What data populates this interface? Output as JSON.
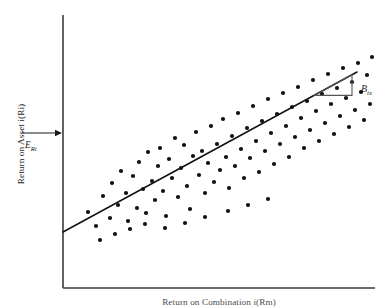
{
  "figure": {
    "y_axis_label": "Return on Asset i(Ri)",
    "x_axis_label": "Return on Combination i(Rm)",
    "expected_return_label": "E",
    "expected_return_subscript": "Ri",
    "beta_label": "B",
    "beta_subscript": "ix",
    "colors": {
      "axis": "#3a3a3a",
      "point": "#111111",
      "line": "#111111",
      "triangle": "#555555",
      "text": "#1a1a1a",
      "background": "#ffffff"
    }
  },
  "chart_data": {
    "type": "scatter",
    "title": "",
    "xlabel": "Return on Combination i(Rm)",
    "ylabel": "Return on Asset i(Ri)",
    "xlim": [
      0,
      100
    ],
    "ylim": [
      0,
      100
    ],
    "grid": false,
    "legend": null,
    "annotations": [
      {
        "name": "expected-return-arrow",
        "text": "E_Ri",
        "type": "arrow",
        "points_to": "y-axis",
        "x_px": 28,
        "y_px": 133,
        "arrow_x1_px": 22,
        "arrow_x2_px": 62
      },
      {
        "name": "beta-slope-triangle",
        "text": "B_ix",
        "type": "slope-triangle",
        "base_x1_px": 314,
        "base_x2_px": 352,
        "base_y_px": 95,
        "apex_y_px": 74
      }
    ],
    "axes_px": {
      "x0": 63,
      "y0": 288,
      "x1": 375,
      "y1": 15
    },
    "regression_line": {
      "name": "characteristic-line",
      "x1_px": 63,
      "y1_px": 232,
      "x2_px": 357,
      "y2_px": 72,
      "slope_px": -0.544
    },
    "points_px": [
      [
        88,
        212
      ],
      [
        96,
        226
      ],
      [
        103,
        196
      ],
      [
        110,
        218
      ],
      [
        112,
        183
      ],
      [
        118,
        205
      ],
      [
        121,
        171
      ],
      [
        126,
        193
      ],
      [
        128,
        221
      ],
      [
        133,
        176
      ],
      [
        137,
        208
      ],
      [
        139,
        162
      ],
      [
        143,
        189
      ],
      [
        146,
        213
      ],
      [
        148,
        152
      ],
      [
        152,
        181
      ],
      [
        155,
        200
      ],
      [
        158,
        166
      ],
      [
        160,
        148
      ],
      [
        163,
        191
      ],
      [
        166,
        216
      ],
      [
        169,
        159
      ],
      [
        172,
        178
      ],
      [
        175,
        138
      ],
      [
        178,
        197
      ],
      [
        181,
        168
      ],
      [
        184,
        145
      ],
      [
        187,
        186
      ],
      [
        190,
        209
      ],
      [
        193,
        156
      ],
      [
        196,
        132
      ],
      [
        199,
        175
      ],
      [
        202,
        151
      ],
      [
        205,
        193
      ],
      [
        208,
        163
      ],
      [
        211,
        126
      ],
      [
        214,
        182
      ],
      [
        217,
        144
      ],
      [
        220,
        170
      ],
      [
        223,
        119
      ],
      [
        226,
        157
      ],
      [
        229,
        188
      ],
      [
        232,
        136
      ],
      [
        235,
        166
      ],
      [
        238,
        113
      ],
      [
        241,
        149
      ],
      [
        244,
        178
      ],
      [
        247,
        128
      ],
      [
        250,
        158
      ],
      [
        253,
        106
      ],
      [
        256,
        141
      ],
      [
        259,
        172
      ],
      [
        262,
        121
      ],
      [
        265,
        151
      ],
      [
        268,
        99
      ],
      [
        271,
        133
      ],
      [
        274,
        164
      ],
      [
        277,
        114
      ],
      [
        280,
        144
      ],
      [
        283,
        93
      ],
      [
        286,
        126
      ],
      [
        289,
        157
      ],
      [
        292,
        107
      ],
      [
        295,
        137
      ],
      [
        298,
        87
      ],
      [
        301,
        118
      ],
      [
        304,
        148
      ],
      [
        307,
        101
      ],
      [
        310,
        130
      ],
      [
        313,
        80
      ],
      [
        316,
        111
      ],
      [
        319,
        141
      ],
      [
        322,
        94
      ],
      [
        325,
        123
      ],
      [
        328,
        74
      ],
      [
        331,
        104
      ],
      [
        334,
        134
      ],
      [
        337,
        88
      ],
      [
        340,
        116
      ],
      [
        343,
        68
      ],
      [
        346,
        98
      ],
      [
        349,
        127
      ],
      [
        352,
        82
      ],
      [
        355,
        110
      ],
      [
        358,
        63
      ],
      [
        361,
        92
      ],
      [
        364,
        120
      ],
      [
        367,
        75
      ],
      [
        370,
        104
      ],
      [
        372,
        57
      ],
      [
        100,
        240
      ],
      [
        115,
        234
      ],
      [
        130,
        229
      ],
      [
        145,
        224
      ],
      [
        165,
        228
      ],
      [
        185,
        223
      ],
      [
        205,
        217
      ],
      [
        228,
        211
      ],
      [
        248,
        205
      ],
      [
        268,
        199
      ]
    ]
  }
}
